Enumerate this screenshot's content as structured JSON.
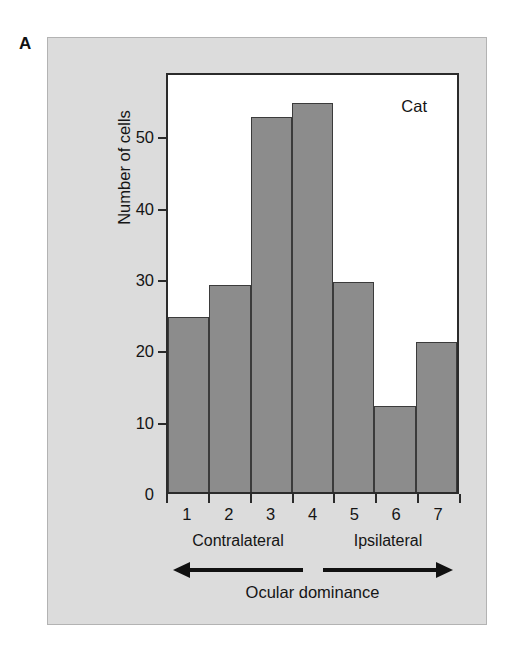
{
  "panel": {
    "letter": "A",
    "background_color": "#dcdcdc"
  },
  "chart_data": {
    "type": "bar",
    "title": "",
    "series_label": "Cat",
    "categories": [
      "1",
      "2",
      "3",
      "4",
      "5",
      "6",
      "7"
    ],
    "values": [
      24.5,
      29,
      52.5,
      54.5,
      29.5,
      12,
      21
    ],
    "xlabel": "Ocular dominance",
    "ylabel": "Number of cells",
    "ylim": [
      0,
      59
    ],
    "yticks": [
      0,
      10,
      20,
      30,
      40,
      50
    ],
    "ytick_labels": [
      "0",
      "10",
      "20",
      "30",
      "40",
      "50"
    ],
    "grid": false,
    "legend": "none",
    "bar_color": "#8c8c8c",
    "bar_edge_color": "#3b3b3b",
    "axis_color": "#2b2b2b",
    "annotations": {
      "left_direction": "Contralateral",
      "right_direction": "Ipsilateral"
    }
  }
}
